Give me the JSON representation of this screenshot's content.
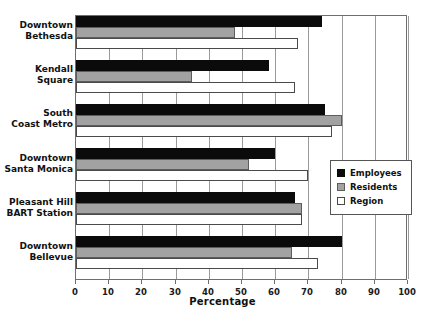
{
  "chart_data": {
    "type": "bar",
    "orientation": "horizontal",
    "title": "",
    "xlabel": "Percentage",
    "ylabel": "",
    "xlim": [
      0,
      100
    ],
    "xticks": [
      0,
      10,
      20,
      30,
      40,
      50,
      60,
      70,
      80,
      90,
      100
    ],
    "xtick_labels": [
      "0",
      "10",
      "20",
      "30",
      "40",
      "50",
      "60",
      "70",
      "80",
      "90",
      "100"
    ],
    "grid": true,
    "grid_axis": "x",
    "legend_position": "center-right",
    "categories": [
      "Downtown\nBethesda",
      "Kendall\nSquare",
      "South\nCoast Metro",
      "Downtown\nSanta Monica",
      "Pleasant Hill\nBART Station",
      "Downtown\nBellevue"
    ],
    "category_lines": [
      [
        "Downtown",
        "Bethesda"
      ],
      [
        "Kendall",
        "Square"
      ],
      [
        "South",
        "Coast Metro"
      ],
      [
        "Downtown",
        "Santa Monica"
      ],
      [
        "Pleasant Hill",
        "BART Station"
      ],
      [
        "Downtown",
        "Bellevue"
      ]
    ],
    "series": [
      {
        "name": "Employees",
        "color": "#0b0b0b",
        "values": [
          74,
          58,
          75,
          60,
          66,
          80
        ]
      },
      {
        "name": "Residents",
        "color": "#a2a2a2",
        "values": [
          48,
          35,
          80,
          52,
          68,
          65
        ]
      },
      {
        "name": "Region",
        "color": "#ffffff",
        "values": [
          67,
          66,
          77,
          70,
          68,
          73
        ]
      }
    ]
  },
  "legend": {
    "items": [
      {
        "label": "Employees",
        "swatch": "employees"
      },
      {
        "label": "Residents",
        "swatch": "residents"
      },
      {
        "label": "Region",
        "swatch": "region"
      }
    ]
  },
  "axis": {
    "x_title": "Percentage"
  },
  "colors": {
    "employees": "#0b0b0b",
    "residents": "#a2a2a2",
    "region": "#ffffff",
    "frame": "#6e6e6e",
    "grid": "#9a9a9a",
    "text": "#111111"
  }
}
